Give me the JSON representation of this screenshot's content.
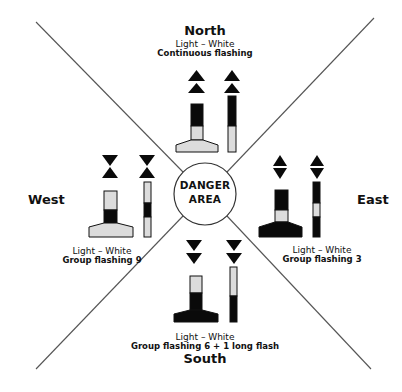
{
  "diagram": {
    "center_label": {
      "line1": "DANGER",
      "line2": "AREA"
    },
    "quadrants": {
      "north": {
        "direction": "North",
        "light": "Light – White",
        "pattern": "Continuous flashing",
        "topmark": "two cones pointing up",
        "colors": "black over yellow"
      },
      "east": {
        "direction": "East",
        "light": "Light – White",
        "pattern": "Group flashing 3",
        "topmark": "two cones base to base",
        "colors": "black with yellow band"
      },
      "south": {
        "direction": "South",
        "light": "Light – White",
        "pattern": "Group flashing 6 + 1 long flash",
        "topmark": "two cones pointing down",
        "colors": "yellow over black"
      },
      "west": {
        "direction": "West",
        "light": "Light – White",
        "pattern": "Group flashing 9",
        "topmark": "two cones point to point",
        "colors": "yellow with black band"
      }
    },
    "colors": {
      "black": "#0a0a0a",
      "light_fill": "#dcdcdc",
      "line": "#555555"
    }
  }
}
